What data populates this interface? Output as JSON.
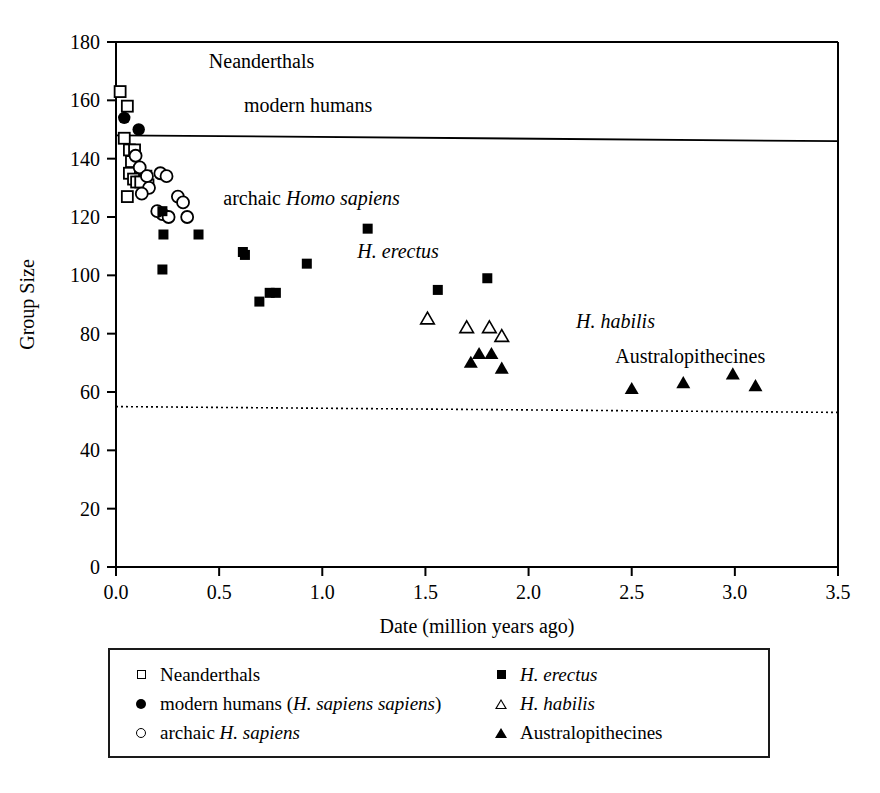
{
  "chart_data": {
    "type": "scatter",
    "title": "",
    "xlabel": "Date (million years ago)",
    "ylabel": "Group Size",
    "xlim": [
      0.0,
      3.5
    ],
    "ylim": [
      0,
      180
    ],
    "xticks": [
      "0.0",
      "0.5",
      "1.0",
      "1.5",
      "2.0",
      "2.5",
      "3.0",
      "3.5"
    ],
    "xtick_values": [
      0.0,
      0.5,
      1.0,
      1.5,
      2.0,
      2.5,
      3.0,
      3.5
    ],
    "yticks": [
      "0",
      "20",
      "40",
      "60",
      "80",
      "100",
      "120",
      "140",
      "160",
      "180"
    ],
    "ytick_values": [
      0,
      20,
      40,
      60,
      80,
      100,
      120,
      140,
      160,
      180
    ],
    "grid": false,
    "legend_position": "below-plot",
    "reference_lines": [
      {
        "name": "modern-human-group-size-line",
        "style": "solid",
        "y_start": 148,
        "y_end": 146
      },
      {
        "name": "chimpanzee-group-size-line",
        "style": "dotted",
        "y_start": 55,
        "y_end": 53
      }
    ],
    "annotations": [
      {
        "text": "Neanderthals",
        "x": 0.45,
        "y": 171,
        "style": "roman"
      },
      {
        "text": "modern humans",
        "x": 0.62,
        "y": 156,
        "style": "roman"
      },
      {
        "text": "archaic ",
        "x": 0.52,
        "y": 124,
        "style": "roman",
        "italic_tail": "Homo sapiens"
      },
      {
        "text": "H. erectus",
        "x": 1.17,
        "y": 106,
        "style": "italic"
      },
      {
        "text": "H. habilis",
        "x": 2.23,
        "y": 82,
        "style": "italic"
      },
      {
        "text": "Australopithecines",
        "x": 2.42,
        "y": 70,
        "style": "roman"
      }
    ],
    "series": [
      {
        "name": "Neanderthals",
        "marker": "open-square",
        "points": [
          [
            0.02,
            163
          ],
          [
            0.055,
            158
          ],
          [
            0.04,
            147
          ],
          [
            0.065,
            143
          ],
          [
            0.09,
            143
          ],
          [
            0.075,
            139
          ],
          [
            0.065,
            135
          ],
          [
            0.085,
            133
          ],
          [
            0.1,
            132
          ],
          [
            0.145,
            134
          ],
          [
            0.155,
            131
          ],
          [
            0.055,
            127
          ],
          [
            0.12,
            132
          ]
        ]
      },
      {
        "name": "modern humans (H. sapiens sapiens)",
        "marker": "filled-circle",
        "points": [
          [
            0.04,
            154
          ],
          [
            0.11,
            150
          ]
        ]
      },
      {
        "name": "archaic H. sapiens",
        "marker": "open-circle",
        "points": [
          [
            0.095,
            141
          ],
          [
            0.115,
            137
          ],
          [
            0.15,
            134
          ],
          [
            0.16,
            130
          ],
          [
            0.125,
            128
          ],
          [
            0.215,
            135
          ],
          [
            0.245,
            134
          ],
          [
            0.3,
            127
          ],
          [
            0.325,
            125
          ],
          [
            0.225,
            121
          ],
          [
            0.255,
            120
          ],
          [
            0.345,
            120
          ],
          [
            0.2,
            122
          ]
        ]
      },
      {
        "name": "H. erectus",
        "marker": "filled-square",
        "points": [
          [
            0.225,
            122
          ],
          [
            0.23,
            114
          ],
          [
            0.4,
            114
          ],
          [
            0.225,
            102
          ],
          [
            0.615,
            108
          ],
          [
            0.625,
            107
          ],
          [
            0.695,
            91
          ],
          [
            0.745,
            94
          ],
          [
            0.775,
            94
          ],
          [
            0.925,
            104
          ],
          [
            1.22,
            116
          ],
          [
            1.56,
            95
          ],
          [
            1.8,
            99
          ]
        ]
      },
      {
        "name": "H. habilis",
        "marker": "open-triangle",
        "points": [
          [
            1.51,
            85
          ],
          [
            1.7,
            82
          ],
          [
            1.81,
            82
          ],
          [
            1.87,
            79
          ]
        ]
      },
      {
        "name": "Australopithecines",
        "marker": "filled-triangle",
        "points": [
          [
            1.72,
            70
          ],
          [
            1.76,
            73
          ],
          [
            1.82,
            73
          ],
          [
            1.87,
            68
          ],
          [
            2.5,
            61
          ],
          [
            2.75,
            63
          ],
          [
            2.99,
            66
          ],
          [
            3.1,
            62
          ]
        ]
      }
    ]
  },
  "axes": {
    "y_title": "Group Size",
    "x_title": "Date (million years ago)"
  },
  "legend": {
    "left_items": [
      {
        "marker": "open-square",
        "label": "Neanderthals"
      },
      {
        "marker": "filled-circle",
        "label": "modern humans (H. sapiens sapiens)"
      },
      {
        "marker": "open-circle",
        "label": "archaic H. sapiens"
      }
    ],
    "right_items": [
      {
        "marker": "filled-square",
        "label": "H. erectus"
      },
      {
        "marker": "open-triangle",
        "label": "H. habilis"
      },
      {
        "marker": "filled-triangle",
        "label": "Australopithecines"
      }
    ]
  }
}
